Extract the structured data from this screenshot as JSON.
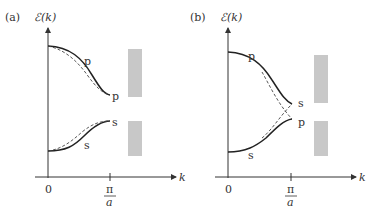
{
  "panels": [
    {
      "id": "a",
      "panel_label": "(a)",
      "y_axis_label": "ℰ(k)",
      "x_axis_label": "k",
      "x_ticks": {
        "origin": "0",
        "zone_edge_num": "π",
        "zone_edge_den": "a"
      },
      "upper_band": {
        "label_mid": "p",
        "label_end": "p"
      },
      "lower_band": {
        "label_mid": "s",
        "label_end": "s"
      },
      "gap_bars": 2
    },
    {
      "id": "b",
      "panel_label": "(b)",
      "y_axis_label": "ℰ(k)",
      "x_axis_label": "k",
      "x_ticks": {
        "origin": "0",
        "zone_edge_num": "π",
        "zone_edge_den": "a"
      },
      "upper_band": {
        "label_mid": "p",
        "label_end": "s"
      },
      "lower_band": {
        "label_mid": "s",
        "label_end": "p"
      },
      "gap_bars": 2
    }
  ],
  "colors": {
    "curve": "#222222",
    "dashed": "#444444",
    "gap_bar": "#c8c8c8",
    "axis": "#333333"
  }
}
